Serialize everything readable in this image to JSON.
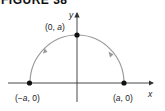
{
  "figure": {
    "title": "FIGURE 38",
    "axes": {
      "x_label": "x",
      "y_label": "y"
    },
    "points": [
      {
        "id": "left",
        "label_prefix": "(−",
        "label_var": "a",
        "label_suffix": ", 0)"
      },
      {
        "id": "top",
        "label_prefix": "(0, ",
        "label_var": "a",
        "label_suffix": ")"
      },
      {
        "id": "right",
        "label_prefix": "(",
        "label_var": "a",
        "label_suffix": ", 0)"
      }
    ],
    "curve": {
      "type": "semicircle",
      "description": "Upper semicircle of radius a traversed counterclockwise from (a, 0) to (-a, 0)",
      "color": "#9a9a9a",
      "direction": "counterclockwise"
    },
    "colors": {
      "axis": "#333333",
      "point": "#111111",
      "curve": "#9a9a9a"
    }
  }
}
